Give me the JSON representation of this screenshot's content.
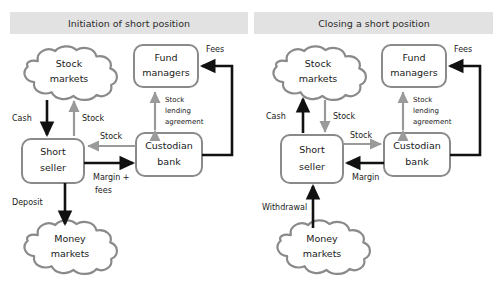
{
  "diagram": {
    "title_left": "Initiation of short position",
    "title_right": "Closing a short position",
    "colors": {
      "header_bar": "#e2e2e2",
      "node_stroke": "#8a8a8a",
      "gray_flow": "#9a9a9a",
      "black_flow": "#111111",
      "background": "#ffffff"
    }
  },
  "panels": [
    {
      "id": "initiation",
      "title": "Initiation of short position",
      "nodes": [
        {
          "id": "stock-markets",
          "label": "Stock\nmarkets",
          "line1": "Stock",
          "line2": "markets",
          "shape": "cloud"
        },
        {
          "id": "fund-managers",
          "label": "Fund\nmanagers",
          "line1": "Fund",
          "line2": "managers",
          "shape": "box"
        },
        {
          "id": "short-seller",
          "label": "Short\nseller",
          "line1": "Short",
          "line2": "seller",
          "shape": "box"
        },
        {
          "id": "custodian-bank",
          "label": "Custodian\nbank",
          "line1": "Custodian",
          "line2": "bank",
          "shape": "box"
        },
        {
          "id": "money-markets",
          "label": "Money\nmarkets",
          "line1": "Money",
          "line2": "markets",
          "shape": "cloud"
        }
      ],
      "edges": [
        {
          "id": "cash",
          "label": "Cash",
          "from": "stock-markets",
          "to": "short-seller",
          "color": "black",
          "direction": "down"
        },
        {
          "id": "stock-up",
          "label": "Stock",
          "from": "short-seller",
          "to": "stock-markets",
          "color": "gray",
          "direction": "up"
        },
        {
          "id": "stock-in",
          "label": "Stock",
          "from": "custodian-bank",
          "to": "short-seller",
          "color": "gray",
          "direction": "left"
        },
        {
          "id": "margin",
          "label_line1": "Margin +",
          "label_line2": "fees",
          "label": "Margin + fees",
          "from": "short-seller",
          "to": "custodian-bank",
          "color": "black",
          "direction": "right"
        },
        {
          "id": "sla",
          "label_line1": "Stock",
          "label_line2": "lending",
          "label_line3": "agreement",
          "label": "Stock lending agreement",
          "from": "custodian-bank",
          "to": "fund-managers",
          "color": "gray",
          "direction": "both"
        },
        {
          "id": "fees",
          "label": "Fees",
          "from": "custodian-bank",
          "to": "fund-managers",
          "color": "black",
          "direction": "up-left"
        },
        {
          "id": "deposit",
          "label": "Deposit",
          "from": "short-seller",
          "to": "money-markets",
          "color": "black",
          "direction": "down"
        }
      ]
    },
    {
      "id": "closing",
      "title": "Closing a short position",
      "nodes": [
        {
          "id": "stock-markets",
          "label": "Stock\nmarkets",
          "line1": "Stock",
          "line2": "markets",
          "shape": "cloud"
        },
        {
          "id": "fund-managers",
          "label": "Fund\nmanagers",
          "line1": "Fund",
          "line2": "managers",
          "shape": "box"
        },
        {
          "id": "short-seller",
          "label": "Short\nseller",
          "line1": "Short",
          "line2": "seller",
          "shape": "box"
        },
        {
          "id": "custodian-bank",
          "label": "Custodian\nbank",
          "line1": "Custodian",
          "line2": "bank",
          "shape": "box"
        },
        {
          "id": "money-markets",
          "label": "Money\nmarkets",
          "line1": "Money",
          "line2": "markets",
          "shape": "cloud"
        }
      ],
      "edges": [
        {
          "id": "cash",
          "label": "Cash",
          "from": "short-seller",
          "to": "stock-markets",
          "color": "black",
          "direction": "up"
        },
        {
          "id": "stock-down",
          "label": "Stock",
          "from": "stock-markets",
          "to": "short-seller",
          "color": "gray",
          "direction": "down"
        },
        {
          "id": "stock-out",
          "label": "Stock",
          "from": "short-seller",
          "to": "custodian-bank",
          "color": "gray",
          "direction": "right"
        },
        {
          "id": "margin",
          "label": "Margin",
          "from": "custodian-bank",
          "to": "short-seller",
          "color": "black",
          "direction": "left"
        },
        {
          "id": "sla",
          "label_line1": "Stock",
          "label_line2": "lending",
          "label_line3": "agreement",
          "label": "Stock lending agreement",
          "from": "custodian-bank",
          "to": "fund-managers",
          "color": "gray",
          "direction": "both"
        },
        {
          "id": "fees",
          "label": "Fees",
          "from": "custodian-bank",
          "to": "fund-managers",
          "color": "black",
          "direction": "up-left"
        },
        {
          "id": "withdrawal",
          "label": "Withdrawal",
          "from": "money-markets",
          "to": "short-seller",
          "color": "black",
          "direction": "up"
        }
      ]
    }
  ]
}
